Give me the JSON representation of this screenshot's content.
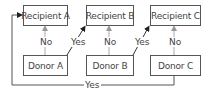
{
  "diagram": {
    "recipients": [
      {
        "label": "Recipient A"
      },
      {
        "label": "Recipient B"
      },
      {
        "label": "Recipient C"
      }
    ],
    "donors": [
      {
        "label": "Donor A"
      },
      {
        "label": "Donor B"
      },
      {
        "label": "Donor C"
      }
    ],
    "edges": {
      "a_no": "No",
      "a_yes": "Yes",
      "b_no": "No",
      "b_yes": "Yes",
      "c_no": "No",
      "c_yes_loop": "Yes"
    },
    "colors": {
      "line": "#555555",
      "arrow_no": "#999999",
      "arrow_yes": "#222222"
    }
  }
}
